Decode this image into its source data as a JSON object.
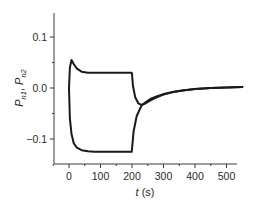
{
  "chart_data": {
    "type": "line",
    "title": "",
    "xlabel": "t (s)",
    "xlabel_italic_part": "t",
    "xlabel_unit": "(s)",
    "ylabel": "P_n1, P_n2",
    "ylabel_parts": {
      "symbol": "P",
      "sub1": "n1",
      "sep": ", ",
      "sub2": "n2"
    },
    "xlim": [
      -50,
      550
    ],
    "ylim": [
      -0.15,
      0.15
    ],
    "xticks": [
      0,
      100,
      200,
      300,
      400,
      500
    ],
    "xtick_labels": [
      "0",
      "100",
      "200",
      "300",
      "400",
      "500"
    ],
    "yticks": [
      0.1,
      0.0,
      -0.1
    ],
    "ytick_labels": [
      "0.1",
      "0.0",
      "−0.1"
    ],
    "grid": false,
    "legend": null,
    "series": [
      {
        "name": "P_n1",
        "color": "#1a1a1a",
        "x": [
          0,
          3,
          8,
          15,
          25,
          40,
          60,
          100,
          150,
          199,
          200,
          203,
          210,
          220,
          230,
          240,
          260,
          280,
          300,
          330,
          360,
          400,
          450,
          500,
          550
        ],
        "y": [
          0.0,
          0.04,
          0.055,
          0.047,
          0.038,
          0.032,
          0.03,
          0.03,
          0.03,
          0.03,
          0.028,
          0.005,
          -0.018,
          -0.03,
          -0.033,
          -0.031,
          -0.024,
          -0.018,
          -0.013,
          -0.008,
          -0.005,
          -0.002,
          0.0,
          0.001,
          0.002
        ]
      },
      {
        "name": "P_n2",
        "color": "#1a1a1a",
        "x": [
          0,
          3,
          8,
          15,
          25,
          40,
          60,
          80,
          100,
          150,
          199,
          200,
          205,
          215,
          230,
          245,
          260,
          280,
          300,
          330,
          360,
          400,
          450,
          500,
          550
        ],
        "y": [
          0.0,
          -0.06,
          -0.09,
          -0.108,
          -0.117,
          -0.122,
          -0.124,
          -0.125,
          -0.125,
          -0.125,
          -0.125,
          -0.12,
          -0.085,
          -0.055,
          -0.035,
          -0.027,
          -0.021,
          -0.016,
          -0.012,
          -0.008,
          -0.005,
          -0.002,
          0.0,
          0.001,
          0.002
        ]
      }
    ],
    "annotations": []
  }
}
